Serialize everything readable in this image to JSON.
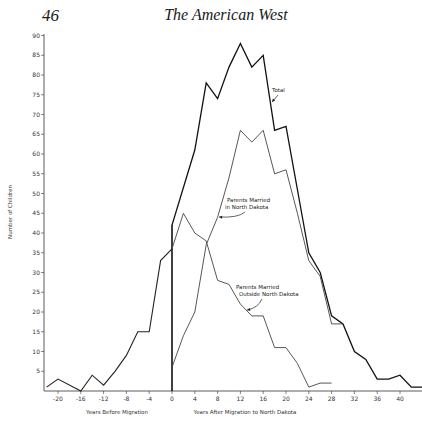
{
  "page": {
    "page_number": "46",
    "running_head": "The American West"
  },
  "chart_data": {
    "type": "line",
    "title": "",
    "xlabel_left": "Years Before Migration",
    "xlabel_right": "Years After Migration to North Dakota",
    "ylabel": "Number of Children",
    "xlim": [
      -22,
      44
    ],
    "ylim": [
      0,
      90
    ],
    "x_ticks": [
      -20,
      -16,
      -12,
      -8,
      -4,
      0,
      4,
      8,
      12,
      16,
      20,
      24,
      28,
      32,
      36,
      40
    ],
    "y_ticks": [
      5,
      10,
      15,
      20,
      25,
      30,
      35,
      40,
      45,
      50,
      55,
      60,
      65,
      70,
      75,
      80,
      85,
      90
    ],
    "grid": false,
    "migration_marker_x": 0,
    "series": [
      {
        "name": "Before Migration",
        "x": [
          -22,
          -20,
          -16,
          -14,
          -12,
          -10,
          -8,
          -6,
          -4,
          -2,
          0
        ],
        "values": [
          1,
          3,
          0,
          4,
          1.5,
          5,
          9,
          15,
          15,
          33,
          36
        ]
      },
      {
        "name": "Total",
        "x": [
          0,
          4,
          6,
          8,
          10,
          12,
          14,
          16,
          18,
          20,
          22,
          24,
          26,
          28,
          30,
          32,
          34,
          36,
          38,
          40,
          42,
          44
        ],
        "values": [
          42,
          61,
          78,
          74,
          82,
          88,
          82,
          85,
          66,
          67,
          51,
          35,
          30,
          19,
          17,
          10,
          8,
          3,
          3,
          4,
          1,
          1
        ]
      },
      {
        "name": "Parents Married in North Dakota",
        "x": [
          0,
          2,
          4,
          6,
          8,
          10,
          12,
          14,
          16,
          18,
          20,
          22,
          24,
          26,
          28,
          30
        ],
        "values": [
          6,
          14,
          20,
          37,
          44,
          54,
          66,
          63,
          66,
          55,
          56,
          45,
          33,
          29,
          17,
          17
        ]
      },
      {
        "name": "Parents Married Outside North Dakota",
        "x": [
          0,
          2,
          4,
          6,
          8,
          10,
          12,
          14,
          16,
          18,
          20,
          22,
          24,
          26,
          28
        ],
        "values": [
          36,
          45,
          40,
          38,
          28,
          27,
          22,
          19,
          19,
          11,
          11,
          7,
          1,
          2,
          2
        ]
      }
    ],
    "annotations": [
      {
        "text": "Total",
        "series": "Total"
      },
      {
        "text_lines": [
          "Parents Married",
          "in North Dakota"
        ],
        "series": "Parents Married in North Dakota"
      },
      {
        "text_lines": [
          "Parents Married",
          "Outside North Dakota"
        ],
        "series": "Parents Married Outside North Dakota"
      }
    ]
  }
}
